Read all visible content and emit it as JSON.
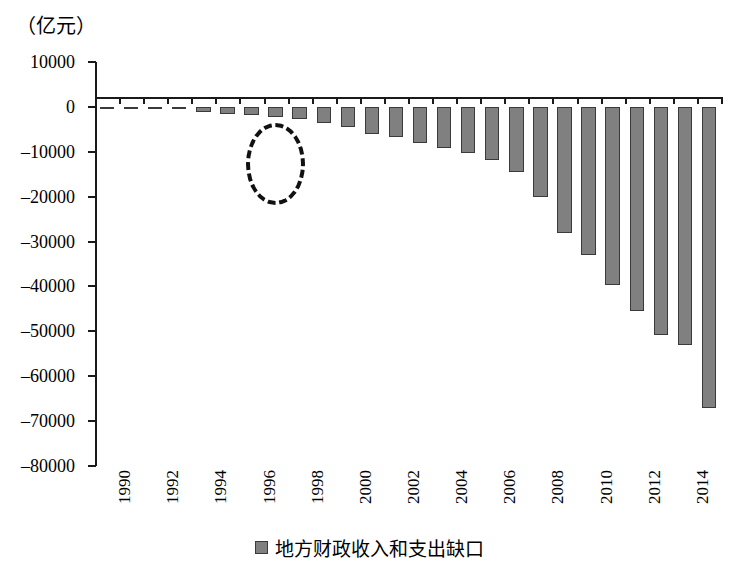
{
  "unit_label": "（亿元）",
  "legend": {
    "swatch_color": "#808080",
    "label": "地方财政收入和支出缺口"
  },
  "annotation": {
    "type": "dashed-ellipse",
    "description": "1993年附近虚线椭圆标注",
    "color": "#111111"
  },
  "chart_data": {
    "type": "bar",
    "title": "",
    "subtitle": "",
    "xlabel": "",
    "ylabel": "（亿元）",
    "unit": "亿元",
    "grid": false,
    "legend_position": "bottom",
    "ylim": [
      -80000,
      10000
    ],
    "ytick_step": 10000,
    "ytick_labels": [
      "10000",
      "0",
      "-10000",
      "-20000",
      "-30000",
      "-40000",
      "-50000",
      "-60000",
      "-70000",
      "-80000"
    ],
    "ytick_values": [
      10000,
      0,
      -10000,
      -20000,
      -30000,
      -40000,
      -50000,
      -60000,
      -70000,
      -80000
    ],
    "xtick_labels": [
      "1990",
      "1992",
      "1994",
      "1996",
      "1998",
      "2000",
      "2002",
      "2004",
      "2006",
      "2008",
      "2010",
      "2012",
      "2014"
    ],
    "categories": [
      "1990",
      "1991",
      "1992",
      "1993",
      "1994",
      "1995",
      "1996",
      "1997",
      "1998",
      "1999",
      "2000",
      "2001",
      "2002",
      "2003",
      "2004",
      "2005",
      "2006",
      "2007",
      "2008",
      "2009",
      "2010",
      "2011",
      "2012",
      "2013",
      "2014",
      "2015"
    ],
    "series": [
      {
        "name": "地方财政收入和支出缺口",
        "color": "#808080",
        "values": [
          -230,
          -260,
          -300,
          -500,
          -1200,
          -1500,
          -1800,
          -2200,
          -2800,
          -3600,
          -4400,
          -6000,
          -6800,
          -8100,
          -9200,
          -10200,
          -11800,
          -14600,
          -20000,
          -28200,
          -33000,
          -39700,
          -45500,
          -50800,
          -53100,
          -67000
        ]
      }
    ]
  }
}
